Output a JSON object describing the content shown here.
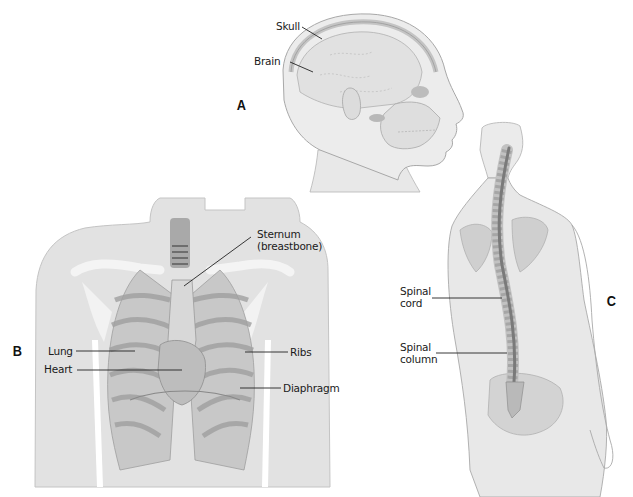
{
  "figures": {
    "A": {
      "letter": "A",
      "subject": "head-skull-brain",
      "labels": {
        "skull": "Skull",
        "brain": "Brain"
      }
    },
    "B": {
      "letter": "B",
      "subject": "chest-thorax",
      "labels": {
        "sternum_line1": "Sternum",
        "sternum_line2": "(breastbone)",
        "lung": "Lung",
        "heart": "Heart",
        "ribs": "Ribs",
        "diaphragm": "Diaphragm"
      }
    },
    "C": {
      "letter": "C",
      "subject": "back-spine",
      "labels": {
        "spinal_cord_line1": "Spinal",
        "spinal_cord_line2": "cord",
        "spinal_column_line1": "Spinal",
        "spinal_column_line2": "column"
      }
    }
  },
  "colors": {
    "skin": "#e4e4e4",
    "skin_outline": "#a8a8a8",
    "bone": "#d2d2d2",
    "organ": "#bcbcbc",
    "dark": "#8a8a8a",
    "leader": "#222222"
  }
}
